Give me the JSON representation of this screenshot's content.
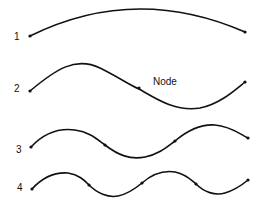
{
  "diagram": {
    "node_label": "Node",
    "modes": [
      {
        "label": "1",
        "half_wavelengths": 1,
        "node_count": 0
      },
      {
        "label": "2",
        "half_wavelengths": 2,
        "node_count": 1
      },
      {
        "label": "3",
        "half_wavelengths": 3,
        "node_count": 2
      },
      {
        "label": "4",
        "half_wavelengths": 4,
        "node_count": 3
      }
    ]
  }
}
